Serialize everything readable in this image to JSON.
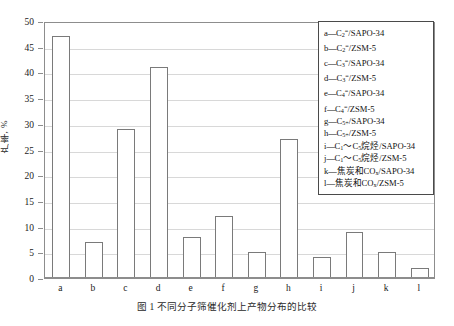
{
  "figure": {
    "caption": "图 1  不同分子筛催化剂上产物分布的比较"
  },
  "axes": {
    "ylabel": "产率, %",
    "yticks": [
      "0",
      "5",
      "10",
      "15",
      "20",
      "25",
      "30",
      "35",
      "40",
      "45",
      "50"
    ],
    "xticks": [
      "a",
      "b",
      "c",
      "d",
      "e",
      "f",
      "g",
      "h",
      "i",
      "j",
      "k",
      "l"
    ]
  },
  "legend": {
    "items": [
      {
        "key": "a",
        "text": "a—C2=/SAPO-34"
      },
      {
        "key": "b",
        "text": "b—C2=/ZSM-5"
      },
      {
        "key": "c",
        "text": "c—C3=/SAPO-34"
      },
      {
        "key": "d",
        "text": "d—C3=/ZSM-5"
      },
      {
        "key": "e",
        "text": "e—C4=/SAPO-34"
      },
      {
        "key": "f",
        "text": "f—C4=/ZSM-5"
      },
      {
        "key": "g",
        "text": "g—C5+/SAPO-34"
      },
      {
        "key": "h",
        "text": "h—C5+/ZSM-5"
      },
      {
        "key": "i",
        "text": "i—C1～C5烷烃/SAPO-34"
      },
      {
        "key": "j",
        "text": "j—C1～C5烷烃/ZSM-5"
      },
      {
        "key": "k",
        "text": "k—焦炭和COx/SAPO-34"
      },
      {
        "key": "l",
        "text": "l—焦炭和COx/ZSM-5"
      }
    ]
  },
  "chart_data": {
    "type": "bar",
    "title": "",
    "xlabel": "",
    "ylabel": "产率, %",
    "ylim": [
      0,
      50
    ],
    "ytick_step": 5,
    "grid": true,
    "legend_position": "upper-right",
    "bar_style": {
      "fill": "#ffffff",
      "edge": "#7a7a7a"
    },
    "categories": [
      "a",
      "b",
      "c",
      "d",
      "e",
      "f",
      "g",
      "h",
      "i",
      "j",
      "k",
      "l"
    ],
    "category_names": [
      "C2=/SAPO-34",
      "C2=/ZSM-5",
      "C3=/SAPO-34",
      "C3=/ZSM-5",
      "C4=/SAPO-34",
      "C4=/ZSM-5",
      "C5+/SAPO-34",
      "C5+/ZSM-5",
      "C1～C5烷烃/SAPO-34",
      "C1～C5烷烃/ZSM-5",
      "焦炭和COx/SAPO-34",
      "焦炭和COx/ZSM-5"
    ],
    "values": [
      47,
      7,
      29,
      41,
      8,
      12,
      5,
      27,
      4,
      9,
      5,
      2
    ]
  }
}
